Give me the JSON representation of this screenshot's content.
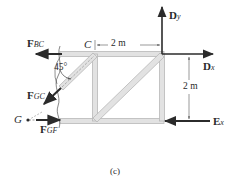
{
  "figure": {
    "caption": "(c)",
    "colors": {
      "member_fill": "#e2e2e2",
      "member_stroke": "#b8b8b8",
      "arrow": "#2b2b2b",
      "dimension": "#555555",
      "background": "#ffffff"
    },
    "forces": {
      "f_bc": {
        "bold": "F",
        "sub": "BC",
        "direction": "left"
      },
      "f_gc": {
        "bold": "F",
        "sub": "GC",
        "direction": "down-left"
      },
      "f_gf": {
        "bold": "F",
        "sub": "GF",
        "direction": "right"
      },
      "d_y": {
        "bold": "D",
        "sub": "y",
        "direction": "up"
      },
      "d_x": {
        "bold": "D",
        "sub": "x",
        "direction": "right"
      },
      "e_x": {
        "bold": "E",
        "sub": "x",
        "direction": "left"
      }
    },
    "points": {
      "c": "C",
      "g": "G"
    },
    "angle": "45°",
    "dimensions": {
      "horizontal": "2 m",
      "vertical": "2 m"
    }
  }
}
